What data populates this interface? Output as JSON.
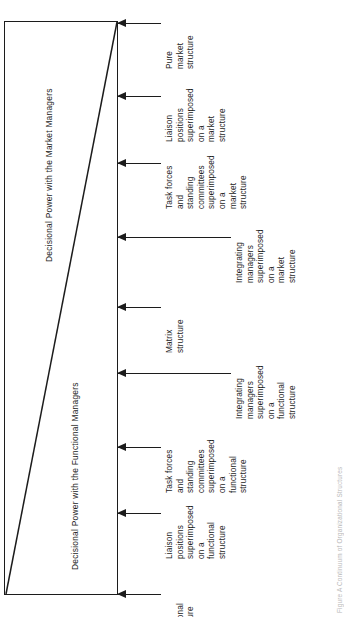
{
  "figure": {
    "type": "continuum-diagram",
    "orientation": "rotated-90-ccw",
    "caption": "Figure  A Continuum of Organizational Structures"
  },
  "box": {
    "market_region_label": "Decisional Power with the Market Managers",
    "functional_region_label": "Decisional Power with the Functional Managers"
  },
  "stages": [
    {
      "index": 0,
      "side": "market",
      "label": "Pure\nmarket\nstructure",
      "arrow_y": 23,
      "line_length": 43,
      "text_offset": 47
    },
    {
      "index": 1,
      "side": "market",
      "label": "Liaison\npositions\nsuperimposed\non a\nmarket\nstructure",
      "arrow_y": 96,
      "line_length": 43,
      "text_offset": 47
    },
    {
      "index": 2,
      "side": "market",
      "label": "Task forces\nand\nstanding\ncommittees\nsuperimposed\non a\nmarket\nstructure",
      "arrow_y": 163,
      "line_length": 43,
      "text_offset": 47
    },
    {
      "index": 3,
      "side": "market",
      "label": "Integrating\nmanagers\nsuperimposed\non a\nmarket\nstructure",
      "arrow_y": 237,
      "line_length": 113,
      "text_offset": 117
    },
    {
      "index": 4,
      "side": "boundary",
      "label": "Matrix\nstructure",
      "arrow_y": 307,
      "line_length": 43,
      "text_offset": 47
    },
    {
      "index": 5,
      "side": "functional",
      "label": "Integrating\nmanagers\nsuperimposed\non a\nfunctional\nstructure",
      "arrow_y": 373,
      "line_length": 113,
      "text_offset": 117
    },
    {
      "index": 6,
      "side": "functional",
      "label": "Task forces\nand\nstanding\ncommittees\nsuperimposed\non a\nfunctional\nstructure",
      "arrow_y": 447,
      "line_length": 43,
      "text_offset": 47
    },
    {
      "index": 7,
      "side": "functional",
      "label": "Liaison\npositions\nsuperimposed\non a\nfunctional\nstructure",
      "arrow_y": 513,
      "line_length": 43,
      "text_offset": 47
    },
    {
      "index": 8,
      "side": "functional",
      "label": "Pure\nfunctional\nstructure",
      "arrow_y": 594,
      "line_length": 43,
      "text_offset": 47
    }
  ],
  "colors": {
    "ink": "#1c1c1c",
    "background": "#ffffff",
    "caption": "#b9b9b9"
  }
}
